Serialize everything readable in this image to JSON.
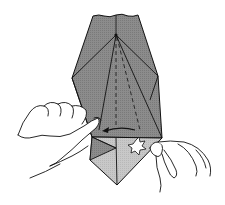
{
  "diagram": {
    "type": "origami-instruction",
    "colors": {
      "paper_dark": "#8a8a8a",
      "paper_mid": "#a8a8a8",
      "paper_light": "#c6c6c6",
      "line": "#111111",
      "background": "#ffffff"
    },
    "elements": {
      "model": "folded paper shape",
      "arrow": "fold-left arrow",
      "star": "push/pivot indicator",
      "left_hand": "left hand holding paper",
      "right_hand": "right hand pinching lower flap"
    }
  }
}
